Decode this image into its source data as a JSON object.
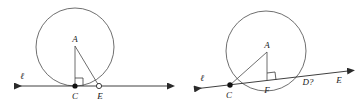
{
  "figure": {
    "background_color": "#ffffff",
    "stroke_color": "#3a3a3a",
    "label_color": "#1a1a1a",
    "width": 356,
    "height": 103
  },
  "left_figure": {
    "name": "tangent-circle-figure",
    "description": "Circle tangent to line at C; right triangle A-C-E with right angle at C",
    "line_label": "ℓ",
    "points": [
      {
        "label": "A",
        "marker": "none",
        "role": "apex-vertex"
      },
      {
        "label": "C",
        "marker": "filled-dot",
        "role": "tangency-point"
      },
      {
        "label": "E",
        "marker": "hollow-dot",
        "role": "point-on-line"
      }
    ],
    "segments": [
      "A-C",
      "A-E"
    ],
    "right_angle_at": "C",
    "line_arrows": "both-ends"
  },
  "right_figure": {
    "name": "secant-circle-figure",
    "description": "Circle cut by a secant line through C and D?; right triangle A-C-F with right angle at F",
    "line_label": "ℓ",
    "points": [
      {
        "label": "A",
        "marker": "none",
        "role": "apex-vertex"
      },
      {
        "label": "C",
        "marker": "filled-dot",
        "role": "left-intersection"
      },
      {
        "label": "F",
        "marker": "none",
        "role": "foot-of-perpendicular"
      },
      {
        "label": "D?",
        "marker": "none",
        "role": "right-intersection"
      },
      {
        "label": "E",
        "marker": "none",
        "role": "point-on-line-far-right"
      }
    ],
    "segments": [
      "A-C",
      "A-F"
    ],
    "right_angle_at": "F",
    "line_arrows": "both-ends"
  }
}
